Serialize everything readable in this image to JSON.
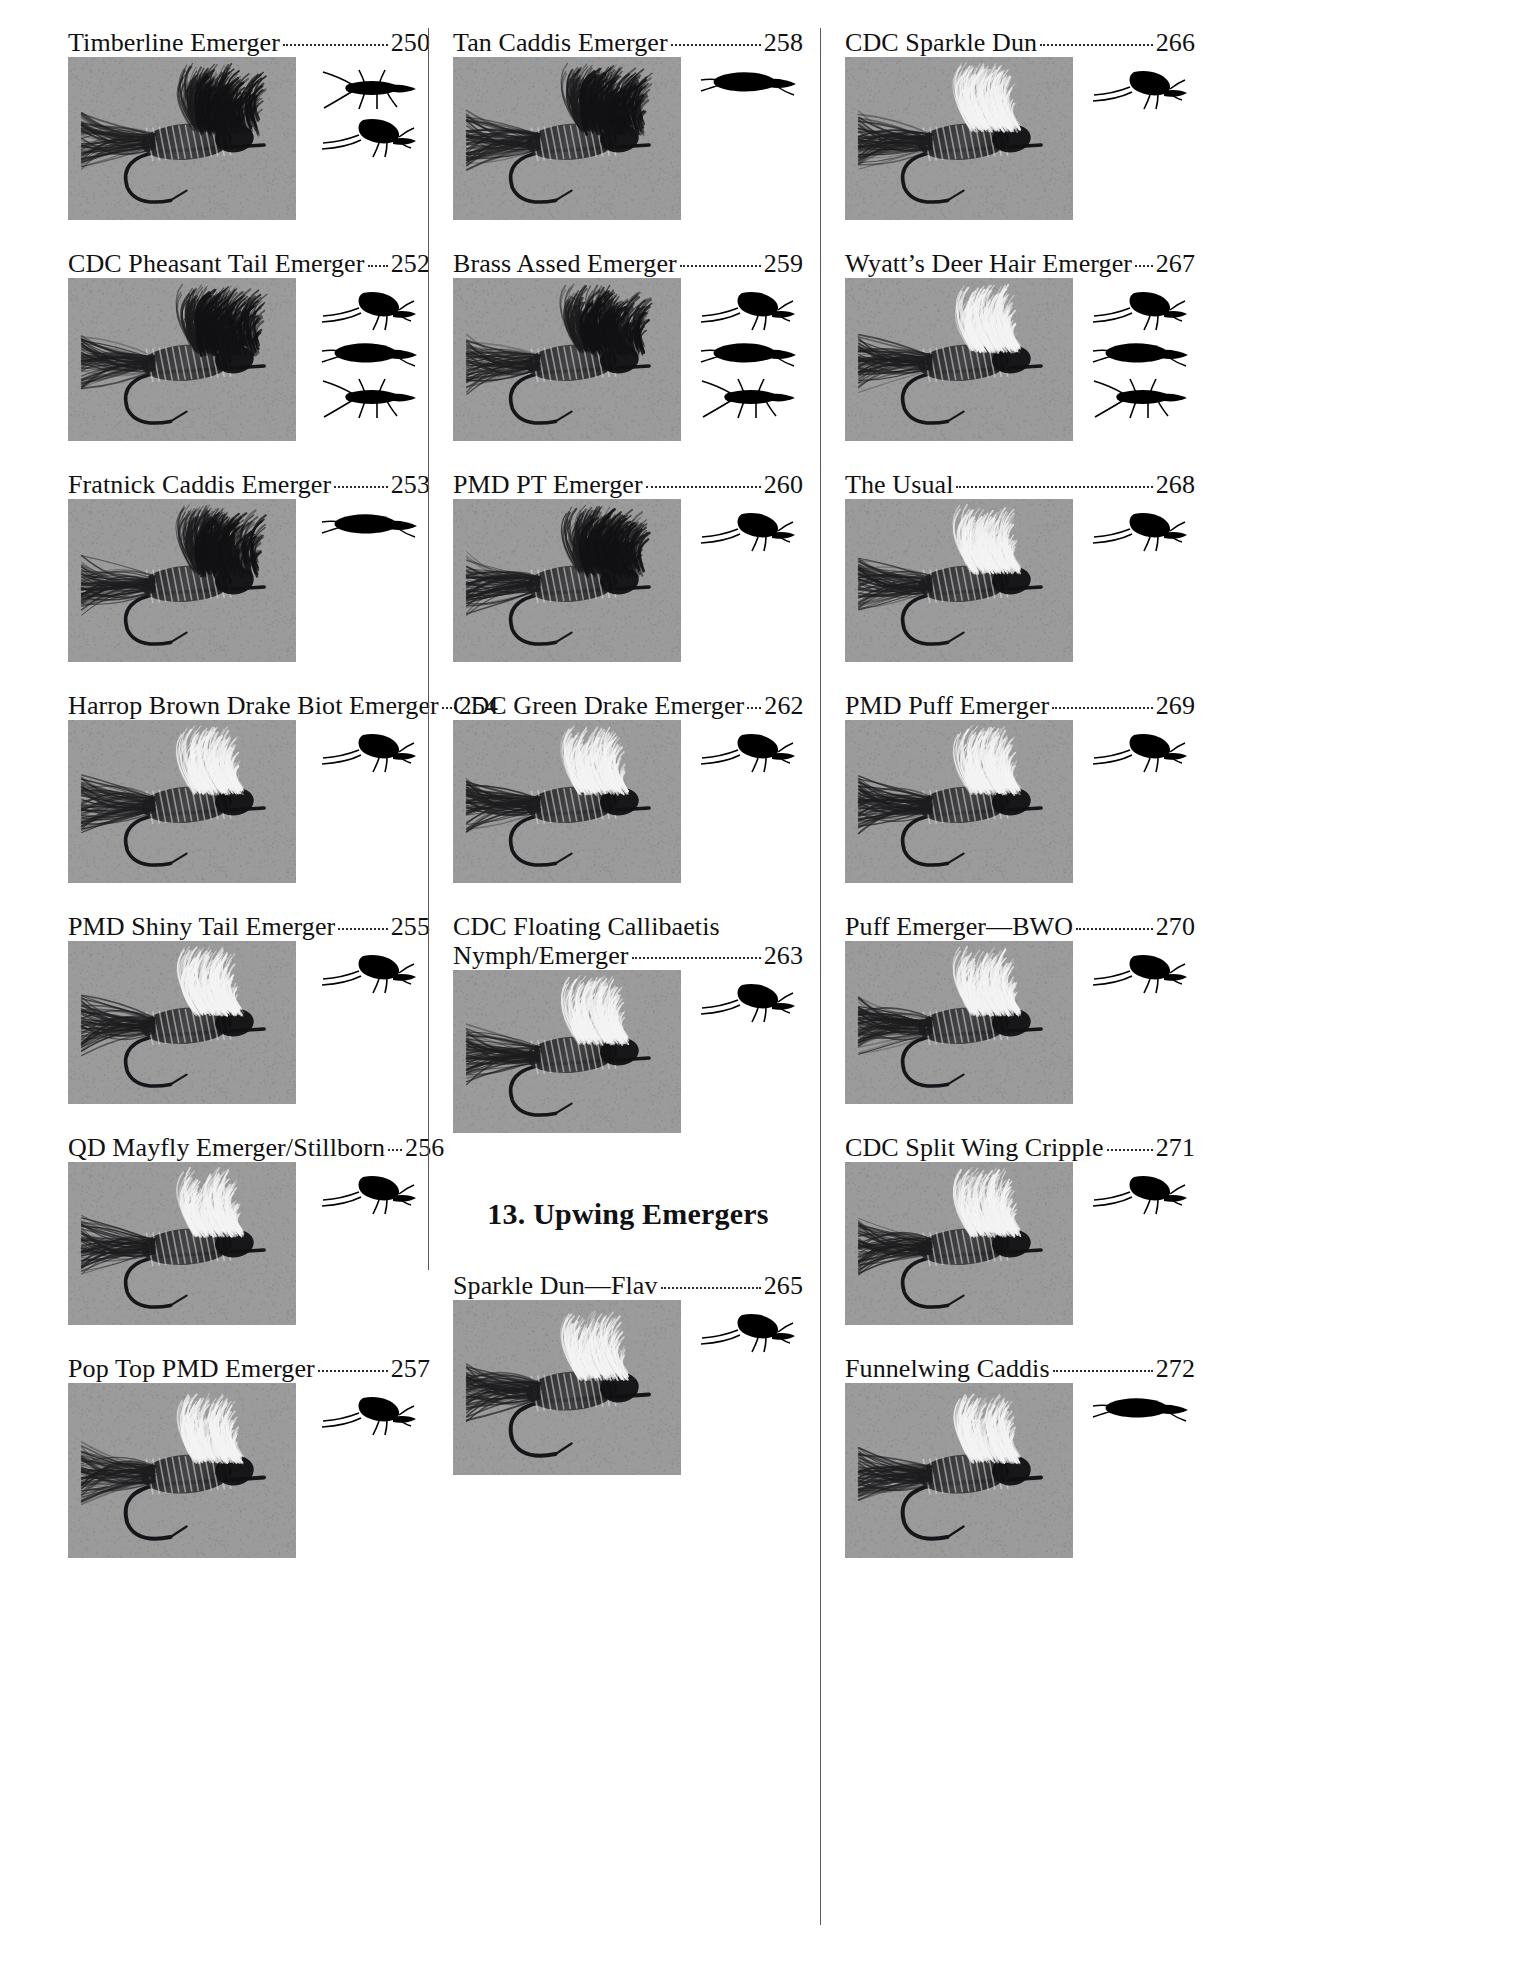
{
  "page": {
    "width": 1538,
    "height": 1977,
    "background": "#ffffff",
    "photo_background": "#9a9a9a",
    "divider_color": "#5a5a5a",
    "text_color": "#111111",
    "leader_style": "dotted"
  },
  "section_heading": {
    "label": "13. Upwing Emergers"
  },
  "columns": [
    {
      "name": "column-1",
      "entries": [
        {
          "title": "Timberline Emerger",
          "page": "250",
          "wrap": false,
          "photo": {
            "w": 228,
            "h": 163,
            "seed": 11,
            "kind": "wet-wing"
          },
          "silhouettes": [
            "stonefly-silhouette",
            "mayfly-silhouette"
          ]
        },
        {
          "title": "CDC Pheasant Tail Emerger",
          "page": "252",
          "wrap": false,
          "photo": {
            "w": 228,
            "h": 163,
            "seed": 23,
            "kind": "nymph"
          },
          "silhouettes": [
            "mayfly-silhouette",
            "caddis-silhouette",
            "stonefly-silhouette"
          ]
        },
        {
          "title": "Fratnick Caddis Emerger",
          "page": "253",
          "wrap": false,
          "photo": {
            "w": 228,
            "h": 163,
            "seed": 37,
            "kind": "caddis"
          },
          "silhouettes": [
            "caddis-silhouette"
          ]
        },
        {
          "title": "Harrop Brown Drake Biot Emerger",
          "page": "254",
          "wrap": false,
          "photo": {
            "w": 228,
            "h": 163,
            "seed": 51,
            "kind": "biot"
          },
          "silhouettes": [
            "mayfly-silhouette"
          ]
        },
        {
          "title": "PMD Shiny Tail Emerger",
          "page": "255",
          "wrap": false,
          "photo": {
            "w": 228,
            "h": 163,
            "seed": 67,
            "kind": "shiny"
          },
          "silhouettes": [
            "mayfly-silhouette"
          ]
        },
        {
          "title": "QD Mayfly Emerger/Stillborn",
          "page": "256",
          "wrap": false,
          "photo": {
            "w": 228,
            "h": 163,
            "seed": 83,
            "kind": "stillborn"
          },
          "silhouettes": [
            "mayfly-silhouette"
          ]
        },
        {
          "title": "Pop Top PMD Emerger",
          "page": "257",
          "wrap": false,
          "photo": {
            "w": 228,
            "h": 175,
            "seed": 97,
            "kind": "poptop"
          },
          "silhouettes": [
            "mayfly-silhouette"
          ]
        }
      ]
    },
    {
      "name": "column-2",
      "entries": [
        {
          "title": "Tan Caddis Emerger",
          "page": "258",
          "wrap": false,
          "photo": {
            "w": 228,
            "h": 163,
            "seed": 13,
            "kind": "tan-caddis"
          },
          "silhouettes": [
            "caddis-silhouette"
          ]
        },
        {
          "title": "Brass Assed Emerger",
          "page": "259",
          "wrap": false,
          "photo": {
            "w": 228,
            "h": 163,
            "seed": 29,
            "kind": "brass"
          },
          "silhouettes": [
            "mayfly-silhouette",
            "caddis-silhouette",
            "stonefly-silhouette"
          ]
        },
        {
          "title": "PMD PT Emerger",
          "page": "260",
          "wrap": false,
          "photo": {
            "w": 228,
            "h": 163,
            "seed": 41,
            "kind": "pmdpt"
          },
          "silhouettes": [
            "mayfly-silhouette"
          ]
        },
        {
          "title": "CDC Green Drake Emerger",
          "page": "262",
          "wrap": false,
          "photo": {
            "w": 228,
            "h": 163,
            "seed": 59,
            "kind": "greendrake"
          },
          "silhouettes": [
            "mayfly-silhouette"
          ]
        },
        {
          "title": "CDC Floating Callibaetis",
          "title2": "Nymph/Emerger",
          "page": "263",
          "wrap": true,
          "photo": {
            "w": 228,
            "h": 163,
            "seed": 71,
            "kind": "callibaetis"
          },
          "silhouettes": [
            "mayfly-silhouette"
          ]
        },
        {
          "title": "Sparkle Dun—Flav",
          "page": "265",
          "wrap": false,
          "photo": {
            "w": 228,
            "h": 175,
            "seed": 89,
            "kind": "sparkledun"
          },
          "silhouettes": [
            "mayfly-silhouette"
          ]
        }
      ]
    },
    {
      "name": "column-3",
      "entries": [
        {
          "title": "CDC Sparkle Dun",
          "page": "266",
          "wrap": false,
          "photo": {
            "w": 228,
            "h": 163,
            "seed": 17,
            "kind": "cdcsparkle"
          },
          "silhouettes": [
            "mayfly-silhouette"
          ]
        },
        {
          "title": "Wyatt’s Deer Hair Emerger",
          "page": "267",
          "wrap": false,
          "photo": {
            "w": 228,
            "h": 163,
            "seed": 31,
            "kind": "deerhair"
          },
          "silhouettes": [
            "mayfly-silhouette",
            "caddis-silhouette",
            "stonefly-silhouette"
          ]
        },
        {
          "title": "The Usual",
          "page": "268",
          "wrap": false,
          "photo": {
            "w": 228,
            "h": 163,
            "seed": 43,
            "kind": "usual"
          },
          "silhouettes": [
            "mayfly-silhouette"
          ]
        },
        {
          "title": "PMD Puff Emerger",
          "page": "269",
          "wrap": false,
          "photo": {
            "w": 228,
            "h": 163,
            "seed": 61,
            "kind": "puff"
          },
          "silhouettes": [
            "mayfly-silhouette"
          ]
        },
        {
          "title": "Puff Emerger—BWO",
          "page": "270",
          "wrap": false,
          "photo": {
            "w": 228,
            "h": 163,
            "seed": 73,
            "kind": "puffbwo"
          },
          "silhouettes": [
            "mayfly-silhouette"
          ]
        },
        {
          "title": "CDC Split Wing Cripple",
          "page": "271",
          "wrap": false,
          "photo": {
            "w": 228,
            "h": 163,
            "seed": 101,
            "kind": "cripple"
          },
          "silhouettes": [
            "mayfly-silhouette"
          ]
        },
        {
          "title": "Funnelwing Caddis",
          "page": "272",
          "wrap": false,
          "photo": {
            "w": 228,
            "h": 175,
            "seed": 107,
            "kind": "funnelwing"
          },
          "silhouettes": [
            "caddis-silhouette"
          ]
        }
      ]
    }
  ]
}
